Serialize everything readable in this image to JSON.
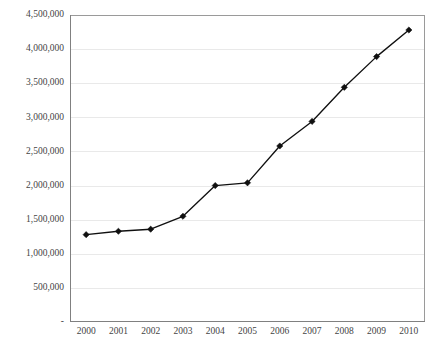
{
  "chart_data": {
    "type": "line",
    "title": "",
    "subtitle": "",
    "xlabel": "",
    "ylabel": "",
    "categories": [
      "2000",
      "2001",
      "2002",
      "2003",
      "2004",
      "2005",
      "2006",
      "2007",
      "2008",
      "2009",
      "2010"
    ],
    "x": [
      2000,
      2001,
      2002,
      2003,
      2004,
      2005,
      2006,
      2007,
      2008,
      2009,
      2010
    ],
    "values": [
      1280000,
      1330000,
      1360000,
      1550000,
      2000000,
      2040000,
      2580000,
      2940000,
      3440000,
      3890000,
      4280000
    ],
    "series": [
      {
        "name": "",
        "values": [
          1280000,
          1330000,
          1360000,
          1550000,
          2000000,
          2040000,
          2580000,
          2940000,
          3440000,
          3890000,
          4280000
        ]
      }
    ],
    "ylim": [
      0,
      4500000
    ],
    "xlim": [
      2000,
      2010
    ],
    "ytick_values": [
      0,
      500000,
      1000000,
      1500000,
      2000000,
      2500000,
      3000000,
      3500000,
      4000000,
      4500000
    ],
    "ytick_labels": [
      "-",
      "500,000",
      "1,000,000",
      "1,500,000",
      "2,000,000",
      "2,500,000",
      "3,000,000",
      "3,500,000",
      "4,000,000",
      "4,500,000"
    ],
    "xtick_labels": [
      "2000",
      "2001",
      "2002",
      "2003",
      "2004",
      "2005",
      "2006",
      "2007",
      "2008",
      "2009",
      "2010"
    ],
    "grid": true,
    "grid_axis": "y",
    "legend": false,
    "legend_position": "none",
    "marker": "diamond",
    "annotations": [],
    "colors": {
      "line": "#101010",
      "marker": "#101010",
      "gridline": "#e9e9e9",
      "axis": "#808080",
      "plot_border": "#9a9a9a",
      "background": "#ffffff",
      "tick_label": "#444444"
    }
  },
  "layout": {
    "plot_left": 70,
    "plot_right": 425,
    "plot_top": 15,
    "plot_bottom": 322,
    "width": 441,
    "height": 350
  }
}
